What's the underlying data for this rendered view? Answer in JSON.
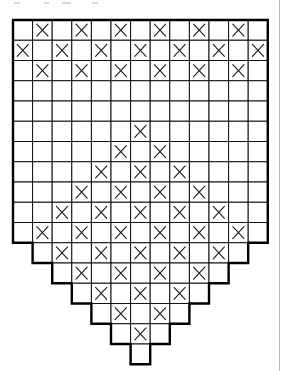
{
  "pattern": {
    "title": "",
    "columns": 13,
    "rows": 17,
    "origin": {
      "x": 13,
      "y": 20
    },
    "cell_width": 19.6,
    "cell_height": 20.25,
    "line_color": "#111111",
    "outline_color": "#000000",
    "mark_symbol": "X",
    "row_spans": [
      [
        0,
        12
      ],
      [
        0,
        12
      ],
      [
        0,
        12
      ],
      [
        0,
        12
      ],
      [
        0,
        12
      ],
      [
        0,
        12
      ],
      [
        0,
        12
      ],
      [
        0,
        12
      ],
      [
        0,
        12
      ],
      [
        0,
        12
      ],
      [
        0,
        12
      ],
      [
        1,
        11
      ],
      [
        2,
        10
      ],
      [
        3,
        9
      ],
      [
        4,
        8
      ],
      [
        5,
        7
      ],
      [
        6,
        6
      ]
    ],
    "marked_cells": [
      [
        1,
        3,
        5,
        7,
        9,
        11
      ],
      [
        0,
        2,
        4,
        6,
        8,
        10,
        12
      ],
      [
        1,
        3,
        5,
        7,
        9,
        11
      ],
      [],
      [],
      [
        6
      ],
      [
        5,
        7
      ],
      [
        4,
        6,
        8
      ],
      [
        3,
        5,
        7,
        9
      ],
      [
        2,
        4,
        6,
        8,
        10
      ],
      [
        1,
        3,
        5,
        7,
        9,
        11
      ],
      [
        2,
        4,
        6,
        8,
        10
      ],
      [
        3,
        5,
        7,
        9
      ],
      [
        4,
        6,
        8
      ],
      [
        5,
        7
      ],
      [
        6
      ],
      []
    ]
  }
}
